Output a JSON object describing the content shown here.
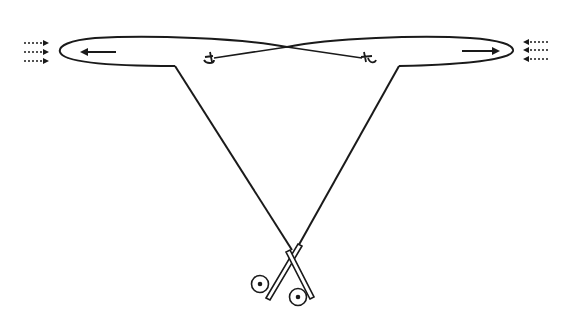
{
  "diagram": {
    "title": "",
    "colors": {
      "ink": "#1a1a1a",
      "background": "#ffffff"
    },
    "elements": {
      "left_loop": {
        "direction_arrow": "left-arrow"
      },
      "right_loop": {
        "direction_arrow": "right-arrow"
      },
      "left_wind_arrows": {
        "count": 3,
        "direction": "right",
        "style": "dotted"
      },
      "right_wind_arrows": {
        "count": 3,
        "direction": "left",
        "style": "dotted"
      },
      "left_marker": {
        "label": ""
      },
      "right_marker": {
        "label": ""
      },
      "handles": {
        "count": 2,
        "style": "crossed-handles-with-reels"
      }
    }
  }
}
